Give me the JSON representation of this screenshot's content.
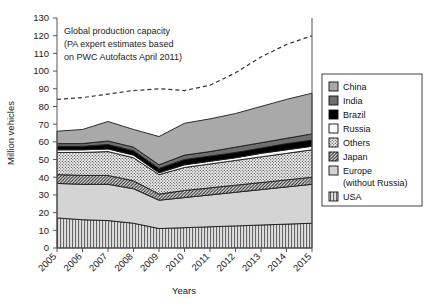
{
  "chart": {
    "type": "area",
    "title": "",
    "xlabel": "Years",
    "ylabel": "Million vehicles",
    "annotation": {
      "line1": "Global production capacity",
      "line2": "(PA expert estimates based",
      "line3": "on PWC Autofacts April 2011)"
    }
  },
  "chart_data": {
    "type": "area",
    "stacked": true,
    "title": "",
    "xlabel": "Years",
    "ylabel": "Million vehicles",
    "xlim": [
      2005,
      2015
    ],
    "ylim": [
      0,
      130
    ],
    "ytick_step": 10,
    "grid": false,
    "legend_position": "right",
    "categories": [
      "2005",
      "2006",
      "2007",
      "2008",
      "2009",
      "2010",
      "2011",
      "2012",
      "2013",
      "2014",
      "2015"
    ],
    "yticks": [
      "0",
      "10",
      "20",
      "30",
      "40",
      "50",
      "60",
      "70",
      "80",
      "90",
      "100",
      "110",
      "120",
      "130"
    ],
    "series": [
      {
        "name": "USA",
        "pattern": "vertical-lines",
        "color": "#d8d8d8",
        "values": [
          17.0,
          16.0,
          15.5,
          14.0,
          11.0,
          11.5,
          12.0,
          12.5,
          13.0,
          13.5,
          14.0
        ]
      },
      {
        "name": "Europe (without Russia)",
        "pattern": "solid-light-gray",
        "color": "#d2d2d2",
        "values": [
          19.5,
          20.0,
          20.5,
          19.5,
          16.0,
          17.0,
          18.0,
          19.0,
          20.0,
          21.0,
          22.0
        ]
      },
      {
        "name": "Japan",
        "pattern": "diagonal-hatch",
        "color": "#bbbbbb",
        "values": [
          5.0,
          5.0,
          5.0,
          4.5,
          3.5,
          4.0,
          4.0,
          4.0,
          4.0,
          4.0,
          4.0
        ]
      },
      {
        "name": "Others",
        "pattern": "dotted-check",
        "color": "#e6e6e6",
        "values": [
          12.5,
          13.0,
          13.5,
          13.0,
          11.0,
          13.0,
          13.5,
          14.0,
          14.5,
          15.0,
          15.5
        ]
      },
      {
        "name": "Russia",
        "pattern": "white",
        "color": "#ffffff",
        "values": [
          1.5,
          1.5,
          1.5,
          1.5,
          1.0,
          1.5,
          1.5,
          1.5,
          2.0,
          2.0,
          2.0
        ]
      },
      {
        "name": "Brazil",
        "pattern": "black",
        "color": "#000000",
        "values": [
          2.0,
          2.0,
          2.5,
          2.5,
          2.5,
          3.0,
          3.0,
          3.0,
          3.0,
          3.5,
          3.5
        ]
      },
      {
        "name": "India",
        "pattern": "dark-gray",
        "color": "#707070",
        "values": [
          1.5,
          1.5,
          2.0,
          2.0,
          2.0,
          2.5,
          2.5,
          3.0,
          3.0,
          3.0,
          3.5
        ]
      },
      {
        "name": "China",
        "pattern": "medium-gray",
        "color": "#a8a8a8",
        "values": [
          7.0,
          8.0,
          11.0,
          10.0,
          16.0,
          18.0,
          18.5,
          19.0,
          20.5,
          22.0,
          23.0
        ]
      }
    ],
    "overlay_series": [
      {
        "name": "Global production capacity",
        "style": "dashed",
        "values": [
          84,
          85,
          87,
          89,
          90,
          89,
          92,
          99,
          108,
          115,
          120
        ]
      }
    ],
    "annotation": "Global production capacity (PA expert estimates based on PWC Autofacts April 2011)"
  },
  "legend": {
    "items": [
      {
        "label": "China",
        "key": "china"
      },
      {
        "label": "India",
        "key": "india"
      },
      {
        "label": "Brazil",
        "key": "brazil"
      },
      {
        "label": "Russia",
        "key": "russia"
      },
      {
        "label": "Others",
        "key": "others"
      },
      {
        "label": "Japan",
        "key": "japan"
      },
      {
        "label": "Europe",
        "key": "europe"
      },
      {
        "label": "(without Russia)",
        "key": "europe-sub"
      },
      {
        "label": "USA",
        "key": "usa"
      }
    ]
  }
}
